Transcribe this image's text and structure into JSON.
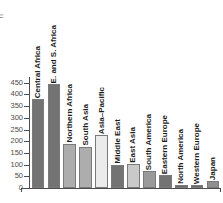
{
  "axis_title_partial": "n",
  "chart_data": {
    "type": "bar",
    "title": "",
    "subtitle": "",
    "xlabel": "",
    "ylabel": "",
    "ylim": [
      0,
      470
    ],
    "grid": false,
    "legend": "none",
    "yticks": [
      0,
      50,
      100,
      150,
      200,
      250,
      300,
      350,
      400,
      450
    ],
    "ytick_labels": [
      "0",
      "50",
      "100",
      "150",
      "200",
      "250",
      "300",
      "350",
      "400",
      "450"
    ],
    "categories": [
      "Central Africa",
      "E. and S. Africa",
      "Northern Africa",
      "South Asia",
      "Asia–Pacific",
      "Middle East",
      "East Asia",
      "South America",
      "Eastern Europe",
      "North America",
      "Western Europe",
      "Japan"
    ],
    "values": [
      380,
      443,
      190,
      177,
      228,
      100,
      103,
      72,
      55,
      12,
      12,
      28
    ],
    "bar_colors": [
      "#737373",
      "#737373",
      "#adadad",
      "#adadad",
      "#ebebeb",
      "#737373",
      "#c9c9c9",
      "#9a9a9a",
      "#737373",
      "#6b6b6b",
      "#6b6b6b",
      "#8f8f8f"
    ],
    "bar_edge_color": "#7a7a7a",
    "axis_color": "#4d4d4d",
    "label_color": "#1c1c1c",
    "tick_label_color": "#4a4a4a",
    "background": "#ffffff"
  }
}
